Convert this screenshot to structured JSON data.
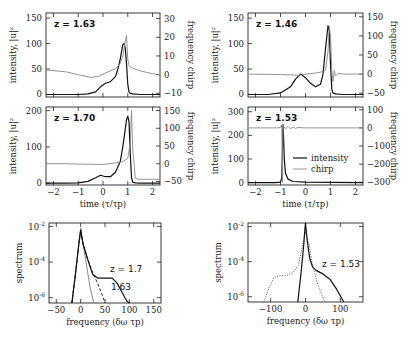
{
  "chart_data": [
    {
      "id": "top-left",
      "type": "line",
      "annotation": "z = 1.63",
      "ylabel": "intensity, |u|²",
      "y2label": "frequency chirp",
      "xlim": [
        -2.3,
        2.3
      ],
      "ylim": [
        -5,
        160
      ],
      "y2lim": [
        -12,
        33
      ],
      "yticks": [
        0,
        50,
        100,
        150
      ],
      "y2ticks": [
        -10,
        0,
        10,
        20,
        30
      ],
      "xticks": [
        -2,
        -1,
        0,
        1,
        2
      ],
      "series": [
        {
          "name": "intensity",
          "axis": "y",
          "x": [
            -2.3,
            -1.5,
            -1.0,
            -0.6,
            -0.3,
            -0.1,
            0.1,
            0.3,
            0.5,
            0.6,
            0.7,
            0.75,
            0.8,
            0.85,
            0.9,
            0.95,
            1.0,
            1.05,
            1.1,
            1.2,
            1.5,
            2.3
          ],
          "values": [
            0,
            0,
            0,
            1,
            5,
            15,
            22,
            25,
            35,
            50,
            70,
            85,
            98,
            100,
            90,
            60,
            20,
            5,
            2,
            1,
            0,
            0
          ]
        },
        {
          "name": "chirp",
          "axis": "y2",
          "x": [
            -2.3,
            -1.5,
            -1.0,
            -0.5,
            -0.2,
            0.2,
            0.5,
            0.7,
            0.8,
            0.9,
            0.95,
            1.0,
            1.05,
            1.1,
            1.2,
            1.5,
            2.0,
            2.3
          ],
          "values": [
            2.5,
            1.5,
            0,
            -1.5,
            -1,
            1.5,
            3,
            6,
            10,
            18,
            21,
            8,
            5,
            4,
            3.5,
            2,
            0.5,
            0
          ]
        }
      ]
    },
    {
      "id": "mid-left",
      "type": "line",
      "annotation": "z = 1.70",
      "ylabel": "intensity, |u|²",
      "y2label": "frequency chirp",
      "xlabel": "time (τ/τp)",
      "xlim": [
        -2.3,
        2.3
      ],
      "ylim": [
        -5,
        210
      ],
      "y2lim": [
        -60,
        160
      ],
      "yticks": [
        0,
        100,
        200
      ],
      "y2ticks": [
        -50,
        0,
        50,
        100,
        150
      ],
      "xticks": [
        -2,
        -1,
        0,
        1,
        2
      ],
      "series": [
        {
          "name": "intensity",
          "axis": "y",
          "x": [
            -2.3,
            -1.5,
            -1.0,
            -0.6,
            -0.3,
            -0.1,
            0.1,
            0.3,
            0.5,
            0.7,
            0.8,
            0.9,
            0.95,
            1.0,
            1.05,
            1.1,
            1.15,
            1.2,
            1.3,
            1.5,
            2.3
          ],
          "values": [
            0,
            0,
            1,
            5,
            15,
            22,
            18,
            18,
            30,
            60,
            100,
            150,
            175,
            185,
            170,
            80,
            15,
            3,
            1,
            0,
            0
          ]
        },
        {
          "name": "chirp",
          "axis": "y2",
          "x": [
            -2.3,
            -1.5,
            -1.0,
            0,
            0.5,
            0.8,
            1.0,
            1.1,
            1.15,
            1.2,
            1.25,
            1.3,
            1.4,
            2.3
          ],
          "values": [
            0,
            0,
            -1,
            -2,
            2,
            6,
            15,
            60,
            150,
            40,
            5,
            -40,
            -44,
            -44
          ]
        }
      ]
    },
    {
      "id": "top-right",
      "type": "line",
      "annotation": "z = 1.46",
      "ylabel": "intensity, |u|²",
      "y2label": "frequency chirp",
      "xlim": [
        -2.3,
        2.3
      ],
      "ylim": [
        -5,
        160
      ],
      "y2lim": [
        -60,
        160
      ],
      "yticks": [
        0,
        50,
        100,
        150
      ],
      "y2ticks": [
        -50,
        0,
        50,
        100,
        150
      ],
      "xticks": [
        -2,
        -1,
        0,
        1,
        2
      ],
      "series": [
        {
          "name": "intensity",
          "axis": "y",
          "x": [
            -2.3,
            -1.5,
            -1.0,
            -0.6,
            -0.4,
            -0.2,
            0,
            0.2,
            0.4,
            0.6,
            0.7,
            0.8,
            0.9,
            0.95,
            1.0,
            1.05,
            1.1,
            1.2,
            1.5,
            2.3
          ],
          "values": [
            0,
            0,
            3,
            15,
            30,
            40,
            33,
            22,
            15,
            20,
            40,
            90,
            135,
            125,
            60,
            10,
            3,
            1,
            0,
            0
          ]
        },
        {
          "name": "chirp",
          "axis": "y2",
          "x": [
            -2.3,
            -1.0,
            -0.3,
            0.3,
            0.6,
            0.8,
            0.9,
            0.95,
            1.0,
            1.05,
            1.1,
            1.15,
            1.2,
            1.3,
            1.5,
            2.3
          ],
          "values": [
            0,
            -1,
            -3,
            2,
            5,
            10,
            60,
            125,
            100,
            10,
            -20,
            10,
            -5,
            2,
            0,
            0
          ]
        }
      ]
    },
    {
      "id": "mid-right",
      "type": "line",
      "annotation": "z = 1.53",
      "ylabel": "intensity, |u|²",
      "y2label": "frequency chirp",
      "xlabel": "time (τ/τp)",
      "xlim": [
        -2.3,
        2.3
      ],
      "ylim": [
        -10,
        320
      ],
      "y2lim": [
        -315,
        115
      ],
      "yticks": [
        0,
        100,
        200,
        300
      ],
      "y2ticks": [
        -300,
        -200,
        -100,
        0,
        100
      ],
      "xticks": [
        -2,
        -1,
        0,
        1,
        2
      ],
      "legend": [
        "intensity",
        "chirp"
      ],
      "series": [
        {
          "name": "intensity",
          "axis": "y",
          "x": [
            -2.3,
            -1.2,
            -1.0,
            -0.95,
            -0.92,
            -0.9,
            -0.88,
            -0.85,
            -0.8,
            -0.7,
            -0.5,
            0,
            1,
            2.3
          ],
          "values": [
            0,
            0,
            2,
            20,
            150,
            245,
            200,
            100,
            40,
            15,
            5,
            2,
            1,
            0
          ]
        },
        {
          "name": "chirp",
          "axis": "y2",
          "x": [
            -2.3,
            -1.1,
            -1.0,
            -0.97,
            -0.95,
            -0.92,
            -0.9,
            -0.85,
            -0.8,
            -0.7,
            -0.6,
            -0.5,
            -0.4,
            -0.3,
            0,
            1,
            2.3
          ],
          "values": [
            0,
            0,
            2,
            15,
            0,
            -300,
            10,
            5,
            -5,
            8,
            -6,
            4,
            -3,
            2,
            0,
            0,
            0
          ]
        }
      ]
    },
    {
      "id": "bottom-left",
      "type": "line",
      "annotation": [
        "z = 1.7",
        "1.63"
      ],
      "ylabel": "spectrum",
      "xlabel": "frequency (δω τp)",
      "xscale": "linear",
      "yscale": "log",
      "xlim": [
        -65,
        165
      ],
      "ylim_log10": [
        -6.3,
        -1.8
      ],
      "yticks": [
        "10⁻²",
        "10⁻⁴",
        "10⁻⁶"
      ],
      "xticks": [
        -50,
        0,
        50,
        100,
        150
      ],
      "series": [
        {
          "name": "initial",
          "style": "thin",
          "x": [
            -18,
            -10,
            -3,
            0,
            5,
            10,
            15,
            20,
            27
          ],
          "values": [
            -6.3,
            -4.5,
            -2.8,
            -2.1,
            -3.0,
            -3.8,
            -4.7,
            -5.5,
            -6.3
          ]
        },
        {
          "name": "z = 1.63",
          "style": "dashed",
          "x": [
            -18,
            -10,
            -3,
            0,
            5,
            15,
            25,
            35,
            45,
            50
          ],
          "values": [
            -6.3,
            -4.5,
            -2.8,
            -2.2,
            -3.0,
            -3.9,
            -4.6,
            -5.2,
            -5.9,
            -6.3
          ]
        },
        {
          "name": "z = 1.7",
          "style": "solid",
          "x": [
            -18,
            -10,
            -3,
            0,
            5,
            15,
            25,
            35,
            50,
            65,
            75,
            85,
            95,
            100
          ],
          "values": [
            -6.3,
            -4.5,
            -2.8,
            -2.2,
            -3.0,
            -3.9,
            -4.7,
            -4.9,
            -4.9,
            -4.9,
            -5.2,
            -5.7,
            -6.2,
            -6.3
          ]
        }
      ]
    },
    {
      "id": "bottom-right",
      "type": "line",
      "annotation": "z = 1.53",
      "ylabel": "spectrum",
      "xlabel": "frequency (δω τp)",
      "xscale": "linear",
      "yscale": "log",
      "xlim": [
        -165,
        165
      ],
      "ylim_log10": [
        -6.3,
        -1.8
      ],
      "yticks": [
        "10⁻²",
        "10⁻⁴",
        "10⁻⁶"
      ],
      "xticks": [
        -100,
        0,
        100
      ],
      "series": [
        {
          "name": "z = 1.53 (dotted)",
          "style": "dotted",
          "x": [
            -120,
            -105,
            -90,
            -75,
            -55,
            -35,
            -20,
            -10,
            0,
            10,
            20,
            35,
            55
          ],
          "values": [
            -6.3,
            -5.5,
            -4.9,
            -4.8,
            -4.8,
            -4.6,
            -4.2,
            -3.2,
            -2.3,
            -3.0,
            -4.2,
            -5.3,
            -6.3
          ]
        },
        {
          "name": "z = 1.53 (solid)",
          "style": "solid",
          "x": [
            -22,
            -12,
            -5,
            -2,
            0,
            2,
            5,
            12,
            20,
            30,
            50,
            70,
            90,
            110
          ],
          "values": [
            -6.3,
            -4.5,
            -3.0,
            -2.2,
            -1.8,
            -2.2,
            -2.8,
            -3.8,
            -4.3,
            -4.5,
            -4.7,
            -5.0,
            -5.6,
            -6.3
          ]
        }
      ]
    }
  ],
  "labels": {
    "time_xlabel": "time (τ/τp)",
    "freq_xlabel": "frequency (δω τp)",
    "intensity_ylabel": "intensity, |u|²",
    "chirp_y2label": "frequency chirp",
    "spectrum_ylabel": "spectrum",
    "legend_intensity": "intensity",
    "legend_chirp": "chirp"
  }
}
